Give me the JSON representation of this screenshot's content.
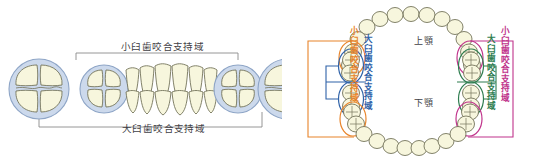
{
  "figure": {
    "panels": {
      "left": {
        "name": "歯列側面模式図",
        "labels": {
          "premolar_zone": "小臼歯咬合支持域",
          "molar_zone": "大臼歯咬合支持域"
        },
        "teeth": [
          {
            "position": 1,
            "type": "molar-occlusal",
            "circled": true,
            "circle_color": "#c6d4e8"
          },
          {
            "position": 2,
            "type": "premolar-occlusal",
            "circled": true,
            "circle_color": "#c6d4e8"
          },
          {
            "position": 3,
            "type": "anterior-frontal",
            "circled": false
          },
          {
            "position": 4,
            "type": "premolar-occlusal",
            "circled": true,
            "circle_color": "#c6d4e8"
          },
          {
            "position": 5,
            "type": "molar-occlusal",
            "circled": true,
            "circle_color": "#c6d4e8"
          }
        ]
      },
      "right": {
        "name": "上下顎歯列弓模式図",
        "labels": {
          "upper_jaw": "上顎",
          "lower_jaw": "下顎",
          "premolar_zone_left": "小臼歯咬合支持域",
          "molar_zone_left": "大臼歯咬合支持域",
          "molar_zone_right": "大臼歯咬合支持域",
          "premolar_zone_right": "小臼歯咬合支持域"
        },
        "zone_colors": {
          "premolar_left": "#e8842a",
          "molar_left": "#2f62a8",
          "molar_right": "#2e7d4f",
          "premolar_right": "#c0338b"
        }
      }
    },
    "colors": {
      "tooth_fill": "#f7f6dd",
      "tooth_outline": "#6f6f52",
      "circle_fill": "#ccd9ec",
      "circle_stroke": "#8ea5c6",
      "bracket": "#8a8a8a",
      "text": "#3f3f46"
    }
  }
}
